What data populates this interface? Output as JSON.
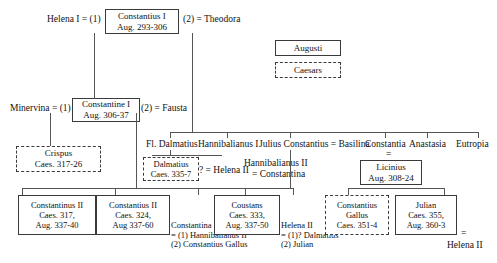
{
  "diagram": {
    "legend": {
      "augusti": "Augusti",
      "caesars": "Caesars"
    },
    "generation1": {
      "helena": "Helena I = (1)",
      "constantius_i": {
        "name": "Constantius I",
        "reign": "Aug. 293-306"
      },
      "theodora": "(2) = Theodora"
    },
    "generation2": {
      "minervina": "Minervina = (1)",
      "constantine_i": {
        "name": "Constantine I",
        "reign": "Aug. 306-37"
      },
      "fausta": "(2) = Fausta"
    },
    "generation2_children": {
      "crispus": {
        "name": "Crispus",
        "reign": "Caes. 317-26"
      }
    },
    "theodora_children": {
      "fl_dalmatius": "Fl. Dalmatius",
      "hannibalianus_i": "Hannibalianus I",
      "julius_constantius": "Julius Constantius = Basilina",
      "constantia": "Constantia",
      "anastasia": "Anastasia",
      "eutropia": "Eutropia"
    },
    "theodora_grandchildren": {
      "dalmatius": {
        "name": "Dalmatius",
        "reign": "Caes. 335-7"
      },
      "dalmatius_marriage": "? = Helena II",
      "hannibalianus_ii": "Hannibalianus II",
      "hannibalianus_ii_marriage": "= Constantina",
      "licinius_eq": "=",
      "licinius": {
        "name": "Licinius",
        "reign": "Aug. 308-24"
      }
    },
    "generation3": {
      "constantinus_ii": {
        "name": "Constantinus II",
        "line2": "Caes. 317,",
        "line3": "Aug. 337-40"
      },
      "constantius_ii": {
        "name": "Constantius II",
        "line2": "Caes. 324,",
        "line3": "Aug 337-60"
      },
      "constantina": {
        "name": "Constantina",
        "m1": "= (1) Hannibalianus II",
        "m2": "(2) Constantius Gallus"
      },
      "coustans": {
        "name": "Coustans",
        "line2": "Caes. 333,",
        "line3": "Aug. 337-50"
      },
      "helena_ii": {
        "name": "Helena II",
        "m1": "= (1)? Dalmatius",
        "m2": "(2) Julian"
      },
      "constantius_gallus": {
        "name": "Constantius",
        "line2": "Gallus",
        "line3": "Caes. 351-4"
      },
      "julian": {
        "name": "Julian",
        "line2": "Caes. 355,",
        "line3": "Aug. 360-3"
      },
      "julian_eq": "=",
      "julian_wife": "Helena II"
    }
  }
}
